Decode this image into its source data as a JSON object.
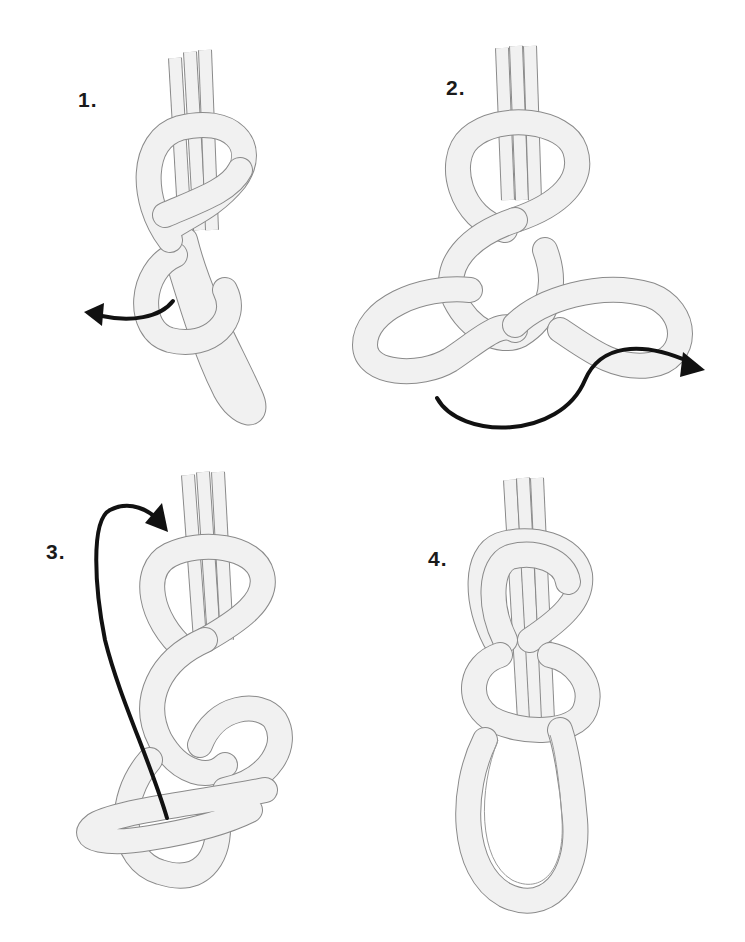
{
  "diagram": {
    "steps": [
      {
        "label": "1.",
        "description": "Figure-eight loop tied in rope; tail passed around",
        "arrow_direction": "left"
      },
      {
        "label": "2.",
        "description": "Tail threaded back through, following the original path",
        "arrow_direction": "right"
      },
      {
        "label": "3.",
        "description": "Tail retraced through the figure-eight",
        "arrow_direction": "up-over"
      },
      {
        "label": "4.",
        "description": "Finished doubled figure-eight loop",
        "arrow_direction": "none"
      }
    ],
    "colors": {
      "rope_fill": "#f1f1f1",
      "rope_outline": "#8a8a8a",
      "arrow": "#111111",
      "label": "#1a1a1a",
      "background": "#ffffff"
    }
  }
}
